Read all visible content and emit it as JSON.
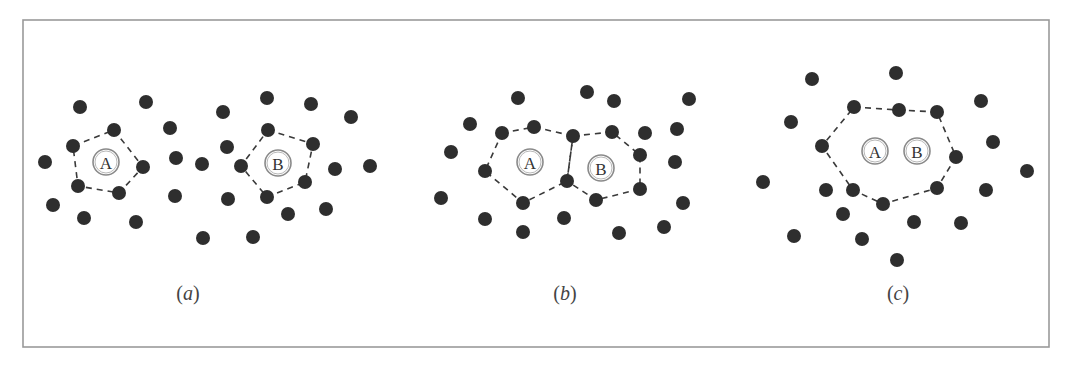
{
  "figure": {
    "frame": {
      "x": 23,
      "y": 20,
      "width": 1026,
      "height": 327,
      "color": "#9a9a9a"
    },
    "dot_color": "#2e2e2e",
    "dot_radius": 7,
    "panels": [
      {
        "id": "a",
        "label_open": "(",
        "label_letter": "a",
        "label_close": ")",
        "label_pos": [
          188,
          293
        ],
        "dots": [
          [
            80,
            107
          ],
          [
            146,
            102
          ],
          [
            114,
            130
          ],
          [
            170,
            128
          ],
          [
            73,
            146
          ],
          [
            45,
            162
          ],
          [
            143,
            167
          ],
          [
            176,
            158
          ],
          [
            78,
            186
          ],
          [
            119,
            193
          ],
          [
            175,
            196
          ],
          [
            53,
            205
          ],
          [
            84,
            218
          ],
          [
            136,
            222
          ],
          [
            267,
            98
          ],
          [
            223,
            112
          ],
          [
            311,
            104
          ],
          [
            351,
            117
          ],
          [
            268,
            130
          ],
          [
            313,
            144
          ],
          [
            227,
            147
          ],
          [
            202,
            164
          ],
          [
            241,
            166
          ],
          [
            335,
            169
          ],
          [
            370,
            166
          ],
          [
            305,
            182
          ],
          [
            267,
            197
          ],
          [
            228,
            199
          ],
          [
            288,
            214
          ],
          [
            326,
            209
          ],
          [
            203,
            238
          ],
          [
            253,
            237
          ]
        ],
        "polygons": [
          [
            [
              114,
              130
            ],
            [
              143,
              167
            ],
            [
              119,
              193
            ],
            [
              78,
              186
            ],
            [
              73,
              146
            ]
          ],
          [
            [
              268,
              130
            ],
            [
              313,
              144
            ],
            [
              305,
              182
            ],
            [
              267,
              197
            ],
            [
              241,
              166
            ]
          ]
        ],
        "particles": [
          {
            "label": "A",
            "pos": [
              106,
              162
            ]
          },
          {
            "label": "B",
            "pos": [
              278,
              163
            ]
          }
        ]
      },
      {
        "id": "b",
        "label_open": "(",
        "label_letter": "b",
        "label_close": ")",
        "label_pos": [
          565,
          293
        ],
        "dots": [
          [
            518,
            98
          ],
          [
            587,
            92
          ],
          [
            614,
            101
          ],
          [
            689,
            99
          ],
          [
            470,
            124
          ],
          [
            534,
            127
          ],
          [
            502,
            133
          ],
          [
            573,
            136
          ],
          [
            612,
            132
          ],
          [
            645,
            133
          ],
          [
            677,
            129
          ],
          [
            451,
            152
          ],
          [
            640,
            155
          ],
          [
            675,
            162
          ],
          [
            485,
            171
          ],
          [
            567,
            181
          ],
          [
            441,
            198
          ],
          [
            523,
            203
          ],
          [
            596,
            200
          ],
          [
            640,
            189
          ],
          [
            683,
            203
          ],
          [
            485,
            219
          ],
          [
            564,
            218
          ],
          [
            523,
            232
          ],
          [
            619,
            233
          ],
          [
            664,
            227
          ]
        ],
        "polygons": [
          [
            [
              502,
              133
            ],
            [
              534,
              127
            ],
            [
              573,
              136
            ],
            [
              567,
              181
            ],
            [
              523,
              203
            ],
            [
              485,
              171
            ]
          ],
          [
            [
              573,
              136
            ],
            [
              612,
              132
            ],
            [
              640,
              155
            ],
            [
              640,
              189
            ],
            [
              596,
              200
            ],
            [
              567,
              181
            ]
          ]
        ],
        "particles": [
          {
            "label": "A",
            "pos": [
              530,
              162
            ]
          },
          {
            "label": "B",
            "pos": [
              601,
              168
            ]
          }
        ]
      },
      {
        "id": "c",
        "label_open": "(",
        "label_letter": "c",
        "label_close": ")",
        "label_pos": [
          898,
          293
        ],
        "dots": [
          [
            812,
            79
          ],
          [
            896,
            73
          ],
          [
            981,
            101
          ],
          [
            791,
            122
          ],
          [
            854,
            107
          ],
          [
            899,
            110
          ],
          [
            937,
            112
          ],
          [
            822,
            146
          ],
          [
            993,
            142
          ],
          [
            956,
            157
          ],
          [
            1027,
            171
          ],
          [
            763,
            182
          ],
          [
            826,
            190
          ],
          [
            853,
            190
          ],
          [
            883,
            204
          ],
          [
            937,
            188
          ],
          [
            986,
            190
          ],
          [
            843,
            214
          ],
          [
            914,
            222
          ],
          [
            961,
            223
          ],
          [
            794,
            236
          ],
          [
            862,
            239
          ],
          [
            897,
            260
          ]
        ],
        "polygons": [
          [
            [
              854,
              107
            ],
            [
              899,
              110
            ],
            [
              937,
              112
            ],
            [
              956,
              157
            ],
            [
              937,
              188
            ],
            [
              883,
              204
            ],
            [
              853,
              190
            ],
            [
              822,
              146
            ]
          ]
        ],
        "particles": [
          {
            "label": "A",
            "pos": [
              875,
              151
            ]
          },
          {
            "label": "B",
            "pos": [
              917,
              151
            ]
          }
        ]
      }
    ]
  }
}
